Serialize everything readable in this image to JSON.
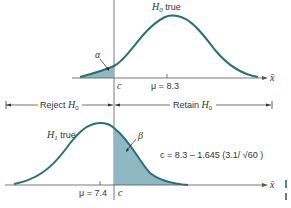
{
  "diagram": {
    "top_panel": {
      "label_hypothesis": "H",
      "label_sub": "0",
      "label_suffix": " true",
      "mean_label": "μ = 8.3",
      "alpha_label": "α",
      "critical_label": "c",
      "axis_label": "x̄"
    },
    "regions": {
      "reject_prefix": "Reject ",
      "reject_h": "H",
      "reject_sub": "0",
      "retain_prefix": "Retain ",
      "retain_h": "H",
      "retain_sub": "0"
    },
    "bottom_panel": {
      "label_hypothesis": "H",
      "label_sub": "1",
      "label_suffix": " true",
      "mean_label": "μ = 7.4",
      "beta_label": "β",
      "critical_label": "c",
      "axis_label": "x̄",
      "formula": "c = 8.3 – 1.645 (3.1/ √60 )"
    },
    "colors": {
      "curve": "#2a6f7a",
      "shade": "#8fb8c2",
      "axis": "#555555"
    }
  }
}
